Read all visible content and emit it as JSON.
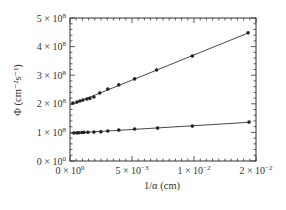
{
  "chart_data": {
    "type": "line",
    "title": "",
    "xlabel": "1/α (cm)",
    "ylabel": "Φ (cm⁻²s⁻¹)",
    "xlim": [
      0,
      0.015
    ],
    "ylim": [
      0,
      500000000
    ],
    "grid": false,
    "legend": null,
    "x_ticks": [
      {
        "value": 0,
        "label": "0 × 10",
        "exp": "0"
      },
      {
        "value": 0.005,
        "label": "5 × 10",
        "exp": "−3"
      },
      {
        "value": 0.01,
        "label": "1 × 10",
        "exp": "−2"
      },
      {
        "value": 0.015,
        "label": "2 × 10",
        "exp": "−2"
      }
    ],
    "y_ticks": [
      {
        "value": 0,
        "label": "0 × 10",
        "exp": "0"
      },
      {
        "value": 100000000,
        "label": "1 × 10",
        "exp": "8"
      },
      {
        "value": 200000000,
        "label": "2 × 10",
        "exp": "8"
      },
      {
        "value": 300000000,
        "label": "3 × 10",
        "exp": "8"
      },
      {
        "value": 400000000,
        "label": "4 × 10",
        "exp": "8"
      },
      {
        "value": 500000000,
        "label": "5 × 10",
        "exp": "8"
      }
    ],
    "series": [
      {
        "name": "upper",
        "x": [
          0.00024,
          0.00056,
          0.0008,
          0.00104,
          0.00136,
          0.0016,
          0.00193,
          0.0024,
          0.00305,
          0.00393,
          0.00521,
          0.00698,
          0.00987,
          0.01436
        ],
        "y": [
          203000000,
          206000000,
          210000000,
          213000000,
          217000000,
          219000000,
          224000000,
          238000000,
          252000000,
          266000000,
          287000000,
          318000000,
          367000000,
          448000000
        ]
      },
      {
        "name": "lower",
        "x": [
          0.00032,
          0.00056,
          0.00072,
          0.00096,
          0.00112,
          0.00144,
          0.00193,
          0.00249,
          0.00305,
          0.00393,
          0.00521,
          0.00706,
          0.00987,
          0.01444
        ],
        "y": [
          98000000,
          98500000,
          99000000,
          99500000,
          100000000,
          100500000,
          101000000,
          102000000,
          105000000,
          108000000,
          112000000,
          115000000,
          122000000,
          136000000
        ]
      }
    ]
  }
}
